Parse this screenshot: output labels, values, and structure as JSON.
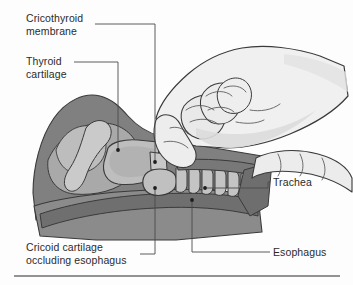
{
  "figure": {
    "kind": "anatomical-illustration",
    "width": 353,
    "height": 285
  },
  "labels": [
    {
      "id": "cricothyroid-membrane",
      "text": "Cricothyroid\nmembrane",
      "lines": [
        "Cricothyroid",
        "membrane"
      ],
      "position": "top-left",
      "marker_point": [
        155,
        162
      ]
    },
    {
      "id": "thyroid-cartilage",
      "text": "Thyroid\ncartilage",
      "lines": [
        "Thyroid",
        "cartilage"
      ],
      "position": "upper-left",
      "marker_point": [
        118,
        150
      ]
    },
    {
      "id": "cricoid-cartilage-occluding-esophagus",
      "text": "Cricoid cartilage\noccluding esophagus",
      "lines": [
        "Cricoid cartilage",
        "occluding esophagus"
      ],
      "position": "bottom-left",
      "marker_point": [
        155,
        188
      ]
    },
    {
      "id": "trachea",
      "text": "Trachea",
      "lines": [
        "Trachea"
      ],
      "position": "right",
      "marker_point": [
        205,
        188
      ]
    },
    {
      "id": "esophagus",
      "text": "Esophagus",
      "lines": [
        "Esophagus"
      ],
      "position": "bottom-right",
      "marker_point": [
        192,
        200
      ]
    }
  ],
  "colors": {
    "background": "#fdfdfd",
    "soft_tissue_dark": "#808080",
    "soft_tissue_mid": "#9a9a9a",
    "cartilage_light": "#b8b8b8",
    "cartilage_pale": "#c6c6c6",
    "hand_fill": "#efefef",
    "hand_shadow": "#dcdcdc",
    "outline": "#3a3a3a",
    "leader_line": "#4a4a4a",
    "text": "#2b2b2b",
    "rule": "#6f6f6f"
  },
  "rule": {
    "present": true,
    "y": 276
  }
}
